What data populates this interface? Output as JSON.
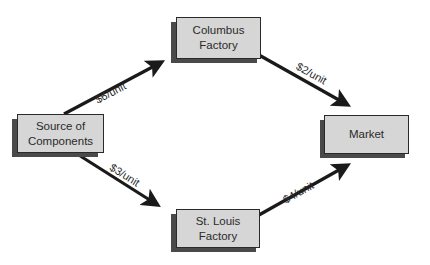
{
  "diagram": {
    "type": "flow-network",
    "nodes": [
      {
        "id": "source",
        "label": "Source of\nComponents"
      },
      {
        "id": "columbus",
        "label": "Columbus\nFactory"
      },
      {
        "id": "stlouis",
        "label": "St. Louis\nFactory"
      },
      {
        "id": "market",
        "label": "Market"
      }
    ],
    "edges": [
      {
        "from": "source",
        "to": "columbus",
        "label": "$6/unit"
      },
      {
        "from": "columbus",
        "to": "market",
        "label": "$2/unit"
      },
      {
        "from": "source",
        "to": "stlouis",
        "label": "$3/unit"
      },
      {
        "from": "stlouis",
        "to": "market",
        "label": "$4/unit"
      }
    ],
    "colors": {
      "node_fill": "#d6d6d6",
      "node_border": "#2a2a2a",
      "node_shadow": "#4a4a4a",
      "arrow": "#1a1a1a",
      "background": "#ffffff"
    }
  }
}
